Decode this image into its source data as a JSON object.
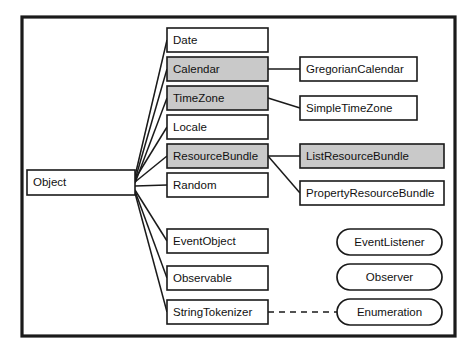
{
  "diagram": {
    "frame": {
      "x": 22,
      "y": 17,
      "width": 433,
      "height": 319
    },
    "colors": {
      "shaded_fill": "#c9c9c9",
      "plain_fill": "#ffffff",
      "stroke": "#1a1a1a",
      "background": "#ffffff"
    },
    "root": {
      "label": "Object",
      "x": 27,
      "y": 170,
      "width": 108,
      "height": 25,
      "shaded": false,
      "shape": "rect"
    },
    "classes": [
      {
        "label": "Date",
        "x": 167,
        "y": 28,
        "width": 101,
        "height": 24,
        "shaded": false,
        "shape": "rect"
      },
      {
        "label": "Calendar",
        "x": 167,
        "y": 57,
        "width": 101,
        "height": 24,
        "shaded": true,
        "shape": "rect"
      },
      {
        "label": "TimeZone",
        "x": 167,
        "y": 86,
        "width": 101,
        "height": 24,
        "shaded": true,
        "shape": "rect"
      },
      {
        "label": "Locale",
        "x": 167,
        "y": 115,
        "width": 101,
        "height": 24,
        "shaded": false,
        "shape": "rect"
      },
      {
        "label": "ResourceBundle",
        "x": 167,
        "y": 144,
        "width": 101,
        "height": 24,
        "shaded": true,
        "shape": "rect"
      },
      {
        "label": "Random",
        "x": 167,
        "y": 173,
        "width": 101,
        "height": 24,
        "shaded": false,
        "shape": "rect"
      },
      {
        "label": "EventObject",
        "x": 167,
        "y": 229,
        "width": 101,
        "height": 24,
        "shaded": false,
        "shape": "rect"
      },
      {
        "label": "Observable",
        "x": 167,
        "y": 266,
        "width": 101,
        "height": 24,
        "shaded": false,
        "shape": "rect"
      },
      {
        "label": "StringTokenizer",
        "x": 167,
        "y": 300,
        "width": 101,
        "height": 24,
        "shaded": false,
        "shape": "rect"
      },
      {
        "label": "GregorianCalendar",
        "x": 300,
        "y": 57,
        "width": 117,
        "height": 24,
        "shaded": false,
        "shape": "rect"
      },
      {
        "label": "SimpleTimeZone",
        "x": 300,
        "y": 96,
        "width": 117,
        "height": 24,
        "shaded": false,
        "shape": "rect"
      },
      {
        "label": "ListResourceBundle",
        "x": 300,
        "y": 144,
        "width": 144,
        "height": 24,
        "shaded": true,
        "shape": "rect"
      },
      {
        "label": "PropertyResourceBundle",
        "x": 300,
        "y": 181,
        "width": 144,
        "height": 24,
        "shaded": false,
        "shape": "rect"
      }
    ],
    "interfaces": [
      {
        "label": "EventListener",
        "x": 337,
        "y": 229,
        "width": 105,
        "height": 26,
        "shape": "rounded"
      },
      {
        "label": "Observer",
        "x": 337,
        "y": 264,
        "width": 105,
        "height": 26,
        "shape": "rounded"
      },
      {
        "label": "Enumeration",
        "x": 337,
        "y": 299,
        "width": 105,
        "height": 26,
        "shape": "rounded"
      }
    ],
    "edges": [
      {
        "from": "Object",
        "to": "Date",
        "style": "solid",
        "path": "M135,176 L167,40"
      },
      {
        "from": "Object",
        "to": "Calendar",
        "style": "solid",
        "path": "M135,180 L167,69"
      },
      {
        "from": "Object",
        "to": "TimeZone",
        "style": "solid",
        "path": "M135,183 L167,98"
      },
      {
        "from": "Object",
        "to": "Locale",
        "style": "solid",
        "path": "M135,179 L167,127"
      },
      {
        "from": "Object",
        "to": "ResourceBundle",
        "style": "solid",
        "path": "M135,182 L167,156"
      },
      {
        "from": "Object",
        "to": "Random",
        "style": "solid",
        "path": "M135,186 L167,185"
      },
      {
        "from": "Object",
        "to": "EventObject",
        "style": "solid",
        "path": "M135,190 L167,241"
      },
      {
        "from": "Object",
        "to": "Observable",
        "style": "solid",
        "path": "M135,191 L167,278"
      },
      {
        "from": "Object",
        "to": "StringTokenizer",
        "style": "solid",
        "path": "M135,193 L167,312"
      },
      {
        "from": "Calendar",
        "to": "GregorianCalendar",
        "style": "solid",
        "path": "M268,69 L300,69"
      },
      {
        "from": "TimeZone",
        "to": "SimpleTimeZone",
        "style": "solid",
        "path": "M268,98 L300,108"
      },
      {
        "from": "ResourceBundle",
        "to": "ListResourceBundle",
        "style": "solid",
        "path": "M268,156 L300,156"
      },
      {
        "from": "ResourceBundle",
        "to": "PropertyResourceBundle",
        "style": "solid",
        "path": "M268,156 L300,193"
      },
      {
        "from": "StringTokenizer",
        "to": "Enumeration",
        "style": "dashed",
        "path": "M268,312 L337,312"
      }
    ]
  }
}
